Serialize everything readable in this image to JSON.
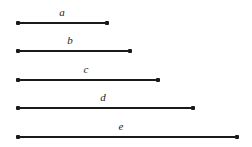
{
  "figure": {
    "width": 252,
    "height": 147,
    "background_color": "#ffffff",
    "line_color": "#1a1a1a",
    "label_color": "#1c1c1c"
  },
  "chart_data": {
    "type": "bar",
    "orientation": "horizontal",
    "title": "",
    "subtitle": "",
    "xlabel": "",
    "ylabel": "",
    "grid": false,
    "legend_position": "none",
    "axis_visible": false,
    "tick_labels_visible": false,
    "categories": [
      "a",
      "b",
      "c",
      "d",
      "e"
    ],
    "values": [
      89,
      112,
      140,
      175,
      219
    ],
    "units": "px",
    "xlim": [
      0,
      252
    ],
    "annotations": [
      "a",
      "b",
      "c",
      "d",
      "e"
    ],
    "segments": [
      {
        "label": "a",
        "x_start": 18,
        "x_end": 107,
        "y": 23,
        "length": 89,
        "label_x": 62,
        "label_y": 12
      },
      {
        "label": "b",
        "x_start": 18,
        "x_end": 130,
        "y": 51,
        "length": 112,
        "label_x": 70,
        "label_y": 40
      },
      {
        "label": "c",
        "x_start": 18,
        "x_end": 158,
        "y": 80,
        "length": 140,
        "label_x": 86,
        "label_y": 69
      },
      {
        "label": "d",
        "x_start": 18,
        "x_end": 193,
        "y": 108,
        "length": 175,
        "label_x": 103,
        "label_y": 97
      },
      {
        "label": "e",
        "x_start": 18,
        "x_end": 237,
        "y": 137,
        "length": 219,
        "label_x": 121,
        "label_y": 126
      }
    ]
  }
}
